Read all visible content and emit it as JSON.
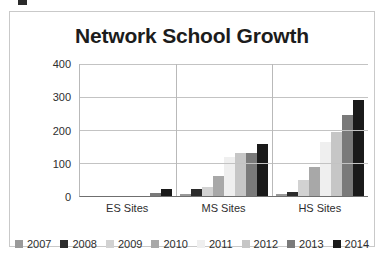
{
  "chart_data": {
    "type": "bar",
    "title": "Network School Growth",
    "xlabel": "",
    "ylabel": "",
    "ylim": [
      0,
      400
    ],
    "yticks": [
      0,
      100,
      200,
      300,
      400
    ],
    "grid": true,
    "legend_position": "bottom",
    "categories": [
      "ES Sites",
      "MS Sites",
      "HS Sites"
    ],
    "series": [
      {
        "name": "2007",
        "color": "#9a9a9a",
        "values": [
          0,
          7,
          6
        ]
      },
      {
        "name": "2008",
        "color": "#2b2b2b",
        "values": [
          0,
          21,
          13
        ]
      },
      {
        "name": "2009",
        "color": "#d2d2d2",
        "values": [
          0,
          27,
          49
        ]
      },
      {
        "name": "2010",
        "color": "#a8a8a8",
        "values": [
          0,
          60,
          87
        ]
      },
      {
        "name": "2011",
        "color": "#efefef",
        "values": [
          0,
          117,
          164
        ]
      },
      {
        "name": "2012",
        "color": "#c6c6c6",
        "values": [
          0,
          130,
          195
        ]
      },
      {
        "name": "2013",
        "color": "#7a7a7a",
        "values": [
          8,
          131,
          245
        ]
      },
      {
        "name": "2014",
        "color": "#1a1a1a",
        "values": [
          22,
          159,
          290
        ]
      }
    ]
  }
}
